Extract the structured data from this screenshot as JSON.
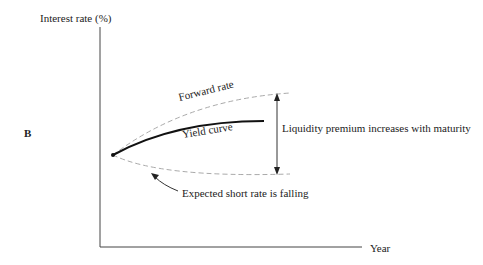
{
  "panel_label": "B",
  "axes": {
    "y_label": "Interest rate (%)",
    "x_label": "Year"
  },
  "curves": {
    "forward_rate": "Forward rate",
    "yield_curve": "Yield curve",
    "expected_short_rate": "Expected short rate is falling"
  },
  "annotations": {
    "liquidity_premium": "Liquidity premium increases with maturity"
  },
  "colors": {
    "axis": "#444444",
    "yield_curve": "#111111",
    "dashed": "#aaaaaa",
    "text": "#222222"
  }
}
